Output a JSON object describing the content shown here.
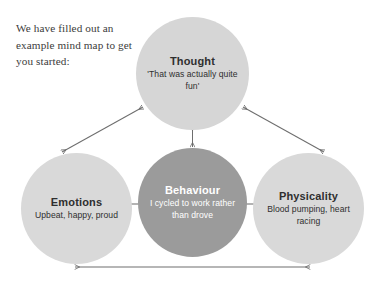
{
  "intro": {
    "text": "We have filled out an example mind map to get you started:"
  },
  "diagram": {
    "name": "example-mind-map",
    "nodes": [
      {
        "id": "thought",
        "title": "Thought",
        "description": "'That was actually quite fun'",
        "fill": "#d6d6d6",
        "text_color": "#2f2f2f"
      },
      {
        "id": "behaviour",
        "title": "Behaviour",
        "description": "I cycled to work rather than drove",
        "fill": "#9b9b9b",
        "text_color": "#ffffff"
      },
      {
        "id": "emotions",
        "title": "Emotions",
        "description": "Upbeat, happy, proud",
        "fill": "#d9d9d9",
        "text_color": "#2f2f2f"
      },
      {
        "id": "physicality",
        "title": "Physicality",
        "description": "Blood pumping, heart racing",
        "fill": "#d9d9d9",
        "text_color": "#2f2f2f"
      }
    ],
    "connectors": [
      {
        "id": "emotions-thought",
        "from": "emotions",
        "to": "thought",
        "style": "double-arrow"
      },
      {
        "id": "thought-physicality",
        "from": "thought",
        "to": "physicality",
        "style": "double-arrow"
      },
      {
        "id": "behaviour-thought",
        "from": "behaviour",
        "to": "thought",
        "style": "double-arrow"
      },
      {
        "id": "emotions-behaviour",
        "from": "emotions",
        "to": "behaviour",
        "style": "double-arrow"
      },
      {
        "id": "behaviour-physicality",
        "from": "behaviour",
        "to": "physicality",
        "style": "double-arrow"
      },
      {
        "id": "emotions-physicality",
        "from": "emotions",
        "to": "physicality",
        "style": "double-arrow"
      }
    ],
    "connector_color": "#6e6e6e"
  }
}
